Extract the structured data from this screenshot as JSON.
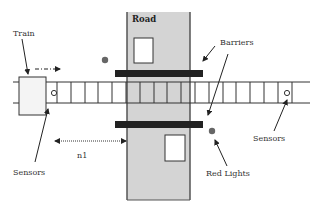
{
  "diagram": {
    "labels": {
      "road": "Road",
      "train": "Train",
      "barriers": "Barriers",
      "sensors_left": "Sensors",
      "sensors_right": "Sensors",
      "red_lights": "Red Lights",
      "distance": "n1"
    },
    "colors": {
      "road_fill": "#d4d4d4",
      "road_border": "#555555",
      "barrier": "#222222",
      "track": "#333333",
      "red_light": "#666666",
      "car_fill": "#ffffff",
      "train_fill": "#f4f4f4"
    },
    "elements": {
      "train_direction": "right",
      "barrier_count": 2,
      "red_light_count": 2,
      "sensor_count": 2,
      "car_count": 2
    }
  }
}
